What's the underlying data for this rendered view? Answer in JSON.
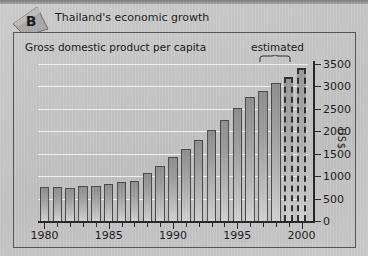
{
  "header": {
    "badge_letter": "B",
    "title": "Thailand's economic growth"
  },
  "chart_data": {
    "type": "bar",
    "title": "Gross domestic product per capita",
    "xlabel": "",
    "ylabel": "US$",
    "ylim": [
      0,
      3500
    ],
    "yticks": [
      0,
      500,
      1000,
      1500,
      2000,
      2500,
      3000,
      3500
    ],
    "ytick_labels": [
      "0",
      "500",
      "1000",
      "1500",
      "2000",
      "2500",
      "3000",
      "3500"
    ],
    "xticks": [
      1980,
      1985,
      1990,
      1995,
      2000
    ],
    "xtick_labels": [
      "1980",
      "1985",
      "1990",
      "1995",
      "2000"
    ],
    "grid": true,
    "legend": null,
    "annotations": [
      {
        "text": "estimated",
        "applies_to_years": [
          1999,
          2000
        ],
        "style": "dashed-outline-bars-with-brace"
      }
    ],
    "categories": [
      "1980",
      "1981",
      "1982",
      "1983",
      "1984",
      "1985",
      "1986",
      "1987",
      "1988",
      "1989",
      "1990",
      "1991",
      "1992",
      "1993",
      "1994",
      "1995",
      "1996",
      "1997",
      "1998",
      "1999",
      "2000"
    ],
    "values": [
      750,
      750,
      745,
      790,
      790,
      820,
      880,
      885,
      1080,
      1230,
      1430,
      1600,
      1800,
      2020,
      2250,
      2530,
      2760,
      2900,
      3080,
      3200,
      3420
    ],
    "estimated_flags": [
      false,
      false,
      false,
      false,
      false,
      false,
      false,
      false,
      false,
      false,
      false,
      false,
      false,
      false,
      false,
      false,
      false,
      false,
      false,
      true,
      true
    ]
  },
  "colors": {
    "panel_background": "#c9c9c9",
    "chart_background": "#c6c6c6",
    "bar_fill": "#a8a8a8",
    "bar_outline": "#4a4a4a",
    "gridline": "#f2f2f2",
    "axis": "#262626",
    "text": "#1a1a1a"
  }
}
